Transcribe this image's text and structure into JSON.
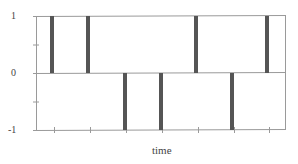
{
  "chart_data": {
    "type": "bar",
    "title": "",
    "xlabel": "time",
    "ylabel": "",
    "ylim": [
      -1,
      1
    ],
    "yticks": [
      1,
      0,
      -1
    ],
    "ytick_labels": [
      "1",
      "0",
      "-1"
    ],
    "grid": false,
    "legend": null,
    "categories": [
      "t1",
      "t2",
      "t3",
      "t4",
      "t5",
      "t6",
      "t7"
    ],
    "values": [
      1,
      1,
      -1,
      -1,
      1,
      -1,
      1
    ],
    "bar_color": "#555555",
    "axis_color": "#999999"
  }
}
